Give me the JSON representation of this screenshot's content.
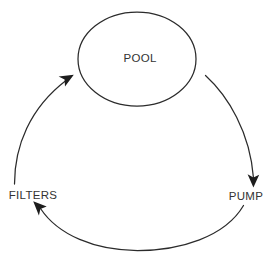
{
  "diagram": {
    "type": "cycle-flow-diagram",
    "background_color": "#ffffff",
    "line_color": "#2b2b2b",
    "text_color": "#333333",
    "nodes": [
      {
        "id": "pool",
        "label": "POOL",
        "shape": "ellipse",
        "cx": 137,
        "cy": 59,
        "rx": 59,
        "ry": 47,
        "label_x": 140,
        "label_y": 62
      },
      {
        "id": "pump",
        "label": "PUMP",
        "shape": "text",
        "label_x": 246,
        "label_y": 200
      },
      {
        "id": "filters",
        "label": "FILTERS",
        "shape": "text",
        "label_x": 33,
        "label_y": 199
      }
    ],
    "edges": [
      {
        "id": "pool-to-pump",
        "from": "pool",
        "to": "pump",
        "direction": "clockwise",
        "arrow_at": "end",
        "arrow_x": 253,
        "arrow_y": 185,
        "arrow_rotation": 100
      },
      {
        "id": "pump-to-filters",
        "from": "pump",
        "to": "filters",
        "direction": "clockwise",
        "arrow_at": "end",
        "arrow_x": 35,
        "arrow_y": 204,
        "arrow_rotation": 212
      },
      {
        "id": "filters-to-pool",
        "from": "filters",
        "to": "pool",
        "direction": "clockwise",
        "arrow_at": "end",
        "arrow_x": 72,
        "arrow_y": 72,
        "arrow_rotation": 333
      }
    ]
  }
}
